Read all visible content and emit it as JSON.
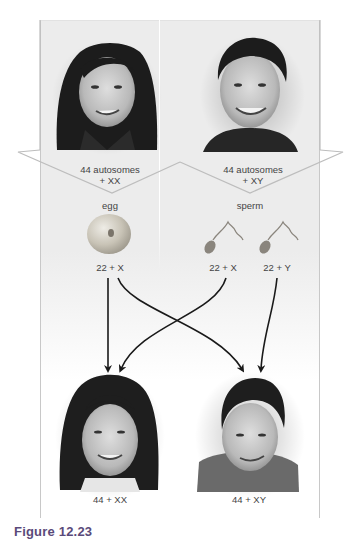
{
  "figure": {
    "caption": "Figure 12.23",
    "parents": {
      "mother": {
        "label_line1": "44 autosomes",
        "label_line2": "+ XX"
      },
      "father": {
        "label_line1": "44 autosomes",
        "label_line2": "+ XY"
      }
    },
    "gametes": {
      "egg": {
        "title": "egg",
        "items": [
          {
            "label": "22 + X"
          }
        ]
      },
      "sperm": {
        "title": "sperm",
        "items": [
          {
            "label": "22 + X"
          },
          {
            "label": "22 + Y"
          }
        ]
      }
    },
    "offspring": [
      {
        "name": "daughter",
        "label": "44 + XX"
      },
      {
        "name": "son",
        "label": "44 + XY"
      }
    ],
    "arrows": [
      {
        "from": "egg 22 + X",
        "to": "daughter 44 + XX"
      },
      {
        "from": "egg 22 + X",
        "to": "son 44 + XY"
      },
      {
        "from": "sperm 22 + X",
        "to": "daughter 44 + XX"
      },
      {
        "from": "sperm 22 + Y",
        "to": "son 44 + XY"
      }
    ],
    "colors": {
      "panel_bg": "#ececec",
      "frame_border": "#c8c8c8",
      "arrow": "#1a1a1a",
      "egg": "#c9c4b8",
      "sperm": "#8a857d",
      "caption": "#5a4a7a"
    }
  }
}
